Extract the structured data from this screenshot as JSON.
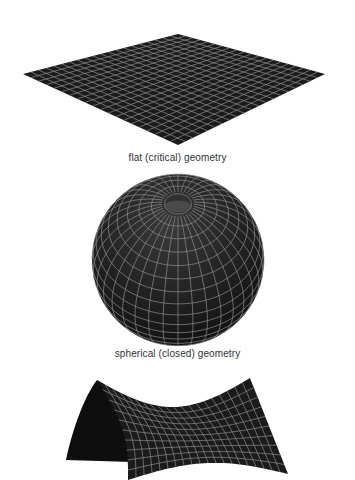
{
  "figures": [
    {
      "id": "flat",
      "caption": "flat (critical) geometry"
    },
    {
      "id": "spherical",
      "caption": "spherical (closed) geometry"
    },
    {
      "id": "saddle",
      "caption": ""
    }
  ],
  "colors": {
    "surface": "#1b1b1b",
    "grid": "#8e8e8e",
    "background": "#ffffff",
    "caption": "#333333"
  }
}
